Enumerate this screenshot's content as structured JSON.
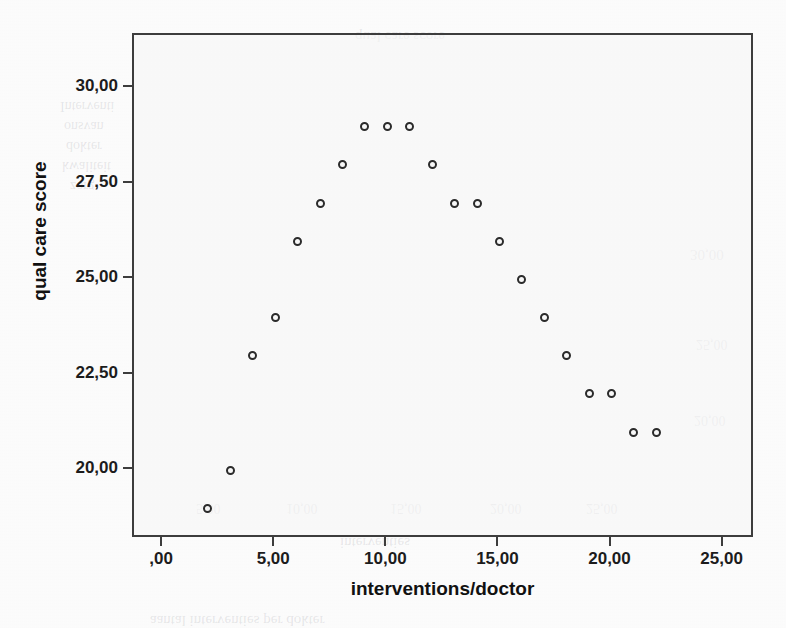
{
  "figure": {
    "kind": "scatterplot",
    "background_color": "#fdfdfd",
    "frame_color": "#3d3d3d",
    "marker_color": "#2b2b2b"
  },
  "axes": {
    "x_title": "interventions/doctor",
    "y_title": "qual care score",
    "x_ticklabels": [
      ",00",
      "5,00",
      "10,00",
      "15,00",
      "20,00",
      "25,00"
    ],
    "y_ticklabels": [
      "30,00",
      "27,50",
      "25,00",
      "22,50",
      "20,00"
    ],
    "x_tickvalues": [
      0,
      5,
      10,
      15,
      20,
      25
    ],
    "y_tickvalues": [
      30,
      27.5,
      25,
      22.5,
      20
    ]
  },
  "bleed_through": [
    {
      "text": "qual care score",
      "left": 355,
      "top": 28,
      "size": 15,
      "rotate": 180
    },
    {
      "text": "Interventi",
      "left": 60,
      "top": 98,
      "size": 14,
      "rotate": 180
    },
    {
      "text": "onsvan",
      "left": 64,
      "top": 118,
      "size": 14,
      "rotate": 180
    },
    {
      "text": "dokter",
      "left": 66,
      "top": 138,
      "size": 14,
      "rotate": 180
    },
    {
      "text": "kwaliteit",
      "left": 62,
      "top": 158,
      "size": 14,
      "rotate": 180
    },
    {
      "text": "zorg",
      "left": 70,
      "top": 178,
      "size": 14,
      "rotate": 180
    },
    {
      "text": "30,00",
      "left": 690,
      "top": 246,
      "size": 15,
      "rotate": 180
    },
    {
      "text": "25,00",
      "left": 696,
      "top": 336,
      "size": 14,
      "rotate": 180
    },
    {
      "text": "20,00",
      "left": 694,
      "top": 412,
      "size": 14,
      "rotate": 180
    },
    {
      "text": "5,00",
      "left": 196,
      "top": 500,
      "size": 14,
      "rotate": 180
    },
    {
      "text": "10,00",
      "left": 286,
      "top": 500,
      "size": 14,
      "rotate": 180
    },
    {
      "text": "15,00",
      "left": 390,
      "top": 500,
      "size": 14,
      "rotate": 180
    },
    {
      "text": "20,00",
      "left": 490,
      "top": 500,
      "size": 14,
      "rotate": 180
    },
    {
      "text": "25,00",
      "left": 586,
      "top": 500,
      "size": 14,
      "rotate": 180
    },
    {
      "text": "interventies",
      "left": 340,
      "top": 534,
      "size": 15,
      "rotate": 180
    },
    {
      "text": "aantal interventies per dokter",
      "left": 150,
      "top": 612,
      "size": 15,
      "rotate": 180
    }
  ],
  "chart_data": {
    "type": "scatter",
    "title": "",
    "xlabel": "interventions/doctor",
    "ylabel": "qual care score",
    "xlim": [
      -1.3,
      26.4
    ],
    "ylim": [
      18.2,
      31.4
    ],
    "grid": false,
    "legend": "none",
    "marker": "open-circle",
    "series": [
      {
        "name": "quality of care vs interventions",
        "points": [
          {
            "x": 2,
            "y": 19.0
          },
          {
            "x": 3,
            "y": 20.0
          },
          {
            "x": 4,
            "y": 23.0
          },
          {
            "x": 5,
            "y": 24.0
          },
          {
            "x": 6,
            "y": 26.0
          },
          {
            "x": 7,
            "y": 27.0
          },
          {
            "x": 8,
            "y": 28.0
          },
          {
            "x": 9,
            "y": 29.0
          },
          {
            "x": 10,
            "y": 29.0
          },
          {
            "x": 11,
            "y": 29.0
          },
          {
            "x": 12,
            "y": 28.0
          },
          {
            "x": 13,
            "y": 27.0
          },
          {
            "x": 14,
            "y": 27.0
          },
          {
            "x": 15,
            "y": 26.0
          },
          {
            "x": 16,
            "y": 25.0
          },
          {
            "x": 17,
            "y": 24.0
          },
          {
            "x": 18,
            "y": 23.0
          },
          {
            "x": 19,
            "y": 22.0
          },
          {
            "x": 20,
            "y": 22.0
          },
          {
            "x": 21,
            "y": 21.0
          },
          {
            "x": 22,
            "y": 21.0
          }
        ]
      }
    ]
  }
}
